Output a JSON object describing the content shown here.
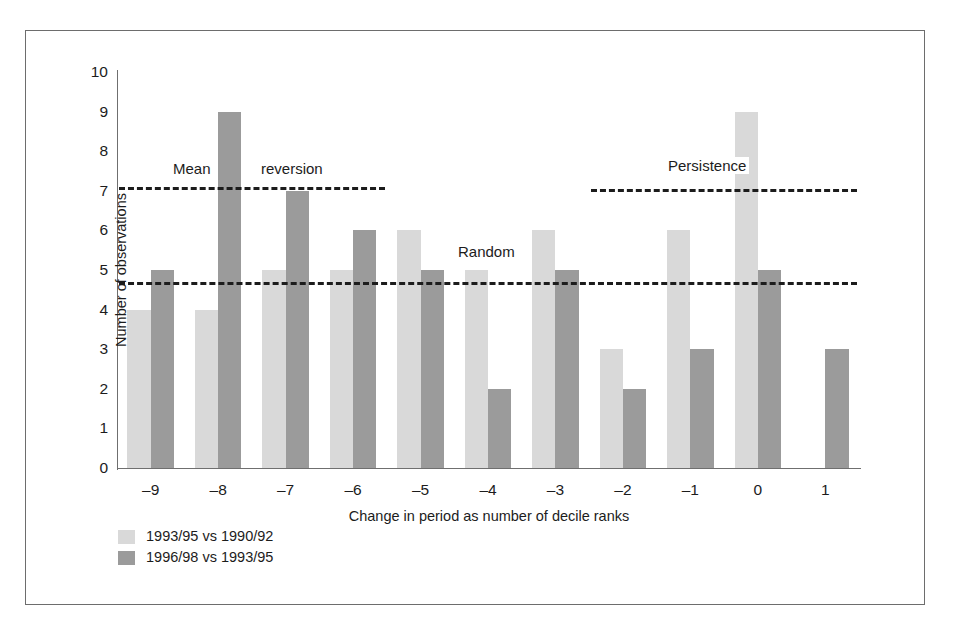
{
  "chart_data": {
    "type": "bar",
    "title": "",
    "xlabel": "Change in period as number of decile ranks",
    "ylabel": "Number of observations",
    "categories": [
      "–9",
      "–8",
      "–7",
      "–6",
      "–5",
      "–4",
      "–3",
      "–2",
      "–1",
      "0",
      "1"
    ],
    "series": [
      {
        "name": "1993/95 vs 1990/92",
        "color": "#d9d9d9",
        "values": [
          4,
          4,
          5,
          5,
          6,
          5,
          6,
          3,
          6,
          9,
          0
        ]
      },
      {
        "name": "1996/98 vs 1993/95",
        "color": "#9b9b9b",
        "values": [
          5,
          9,
          7,
          6,
          5,
          2,
          5,
          2,
          3,
          5,
          3
        ]
      }
    ],
    "ylim": [
      0,
      10
    ],
    "yticks": [
      "0",
      "1",
      "2",
      "3",
      "4",
      "5",
      "6",
      "7",
      "8",
      "9",
      "10"
    ],
    "ytick_values": [
      0,
      1,
      2,
      3,
      4,
      5,
      6,
      7,
      8,
      9,
      10
    ],
    "grid": false,
    "legend_position": "below-left",
    "annotations": [
      {
        "label": "Mean",
        "kind": "text",
        "value": 7.1,
        "x_start": "–9",
        "x_end": "–6"
      },
      {
        "label": "reversion",
        "kind": "text",
        "value": 7.1,
        "x_start": "–9",
        "x_end": "–6"
      },
      {
        "label": "Random",
        "kind": "text",
        "value": 4.7,
        "x_start": "–9",
        "x_end": "1"
      },
      {
        "label": "Persistence",
        "kind": "text",
        "value": 7.05,
        "x_start": "–2",
        "x_end": "1"
      }
    ],
    "reference_lines": [
      {
        "name": "mean-reversion-line",
        "label": "Mean reversion",
        "value": 7.1,
        "style": "dashed",
        "color": "#1c1c1c",
        "x_start": "–9",
        "x_end": "–6"
      },
      {
        "name": "random-line",
        "label": "Random",
        "value": 4.7,
        "style": "dashed",
        "color": "#1c1c1c",
        "x_start": "–9",
        "x_end": "1"
      },
      {
        "name": "persistence-line",
        "label": "Persistence",
        "value": 7.05,
        "style": "dashed",
        "color": "#1c1c1c",
        "x_start": "–2",
        "x_end": "1"
      }
    ]
  },
  "legend": {
    "items": [
      {
        "label": "1993/95 vs 1990/92",
        "color": "#d9d9d9"
      },
      {
        "label": "1996/98 vs 1993/95",
        "color": "#9b9b9b"
      }
    ]
  },
  "axes": {
    "y_title": "Number of observations",
    "x_title": "Change in period as number of decile ranks"
  }
}
